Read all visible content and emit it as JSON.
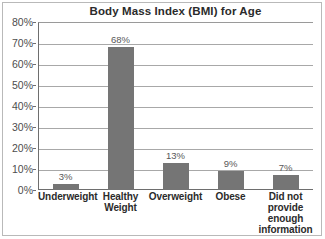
{
  "chart_data": {
    "type": "bar",
    "title": "Body Mass Index (BMI) for Age",
    "xlabel": "",
    "ylabel": "",
    "categories": [
      "Underweight",
      "Healthy Weight",
      "Overweight",
      "Obese",
      "Did not provide enough information"
    ],
    "category_lines": [
      [
        "Underweight"
      ],
      [
        "Healthy",
        "Weight"
      ],
      [
        "Overweight"
      ],
      [
        "Obese"
      ],
      [
        "Did not",
        "provide",
        "enough",
        "information"
      ]
    ],
    "values": [
      3,
      68,
      13,
      9,
      7
    ],
    "data_labels": [
      "3%",
      "68%",
      "13%",
      "9%",
      "7%"
    ],
    "ylim": [
      0,
      80
    ],
    "ytick_values": [
      0,
      10,
      20,
      30,
      40,
      50,
      60,
      70,
      80
    ],
    "ytick_labels": [
      "0%",
      "10%",
      "20%",
      "30%",
      "40%",
      "50%",
      "60%",
      "70%",
      "80%"
    ],
    "grid": true,
    "legend": "none",
    "bar_color": "#757575",
    "grid_color": "#a8a8a8",
    "axis_color": "#6e6e6e",
    "background_color": "#ffffff",
    "title_color": "#2b2b2b",
    "tick_label_color": "#4d4d4d",
    "category_label_color": "#2b2b2b",
    "data_label_color": "#585858"
  }
}
